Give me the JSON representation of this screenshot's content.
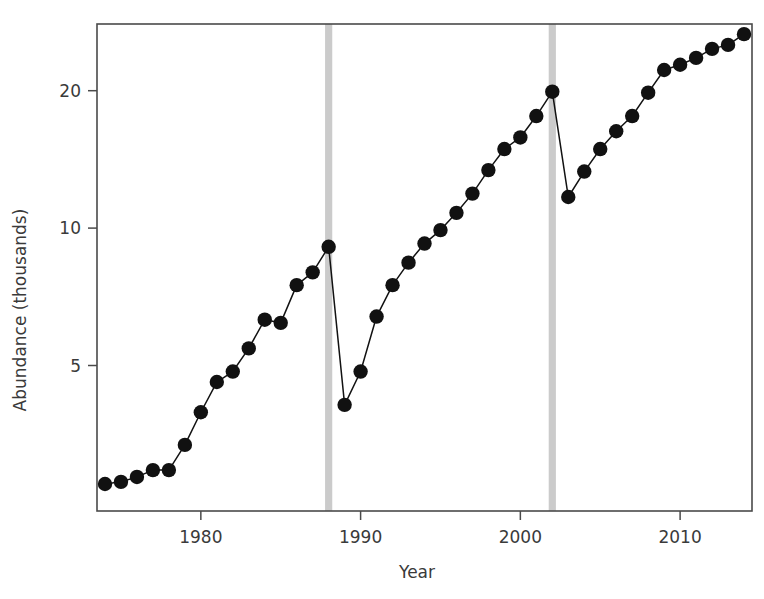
{
  "chart_data": {
    "type": "line",
    "title": "",
    "subtitle": "",
    "xlabel": "Year",
    "ylabel": "Abundance (thousands)",
    "yscale": "log",
    "xscale": "linear",
    "grid": false,
    "legend": null,
    "xlim": [
      1973.5,
      2014.5
    ],
    "ylim": [
      2.4,
      28.0
    ],
    "xticks": [
      1980,
      1990,
      2000,
      2010
    ],
    "xtick_labels": [
      "1980",
      "1990",
      "2000",
      "2010"
    ],
    "yticks": [
      5,
      10,
      20
    ],
    "ytick_labels": [
      "5",
      "10",
      "20"
    ],
    "marker": "filled-circle",
    "marker_color": "#111111",
    "line_color": "#121212",
    "series": [
      {
        "name": "Abundance",
        "x": [
          1974,
          1975,
          1976,
          1977,
          1978,
          1979,
          1980,
          1981,
          1982,
          1983,
          1984,
          1985,
          1986,
          1987,
          1988,
          1989,
          1990,
          1991,
          1992,
          1993,
          1994,
          1995,
          1996,
          1997,
          1998,
          1999,
          2000,
          2001,
          2002,
          2003,
          2004,
          2005,
          2006,
          2007,
          2008,
          2009,
          2010,
          2011,
          2012,
          2013,
          2014
        ],
        "values": [
          2.75,
          2.78,
          2.85,
          2.95,
          2.95,
          3.35,
          3.95,
          4.6,
          4.85,
          5.45,
          6.3,
          6.2,
          7.5,
          8.0,
          9.1,
          4.1,
          4.85,
          6.4,
          7.5,
          8.4,
          9.25,
          9.9,
          10.8,
          11.9,
          13.4,
          14.9,
          15.8,
          17.6,
          19.9,
          11.7,
          13.3,
          14.9,
          16.3,
          17.6,
          19.8,
          22.2,
          22.8,
          23.6,
          24.7,
          25.2,
          26.6
        ]
      }
    ],
    "annotations": [
      {
        "type": "vertical-band",
        "name": "event-band-1988",
        "x": 1988,
        "width_years": 0.45,
        "color": "#c8c8c8"
      },
      {
        "type": "vertical-band",
        "name": "event-band-2002",
        "x": 2002,
        "width_years": 0.45,
        "color": "#c8c8c8"
      }
    ]
  }
}
